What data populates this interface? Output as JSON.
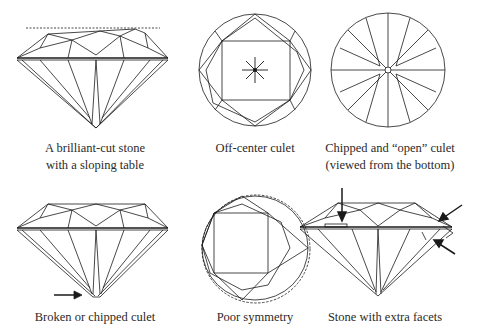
{
  "figures": [
    {
      "id": "sloping-table",
      "caption": [
        "A brilliant-cut stone",
        "with a sloping table"
      ]
    },
    {
      "id": "off-center-culet",
      "caption": [
        "Off-center culet"
      ]
    },
    {
      "id": "chipped-open-culet",
      "caption": [
        "Chipped and “open” culet",
        "(viewed from the bottom)"
      ]
    },
    {
      "id": "broken-chipped-culet",
      "caption": [
        "Broken or chipped culet"
      ]
    },
    {
      "id": "poor-symmetry",
      "caption": [
        "Poor symmetry"
      ]
    },
    {
      "id": "extra-facets",
      "caption": [
        "Stone with extra facets"
      ]
    }
  ],
  "colors": {
    "line": "#1a1a1a",
    "background": "#ffffff"
  }
}
